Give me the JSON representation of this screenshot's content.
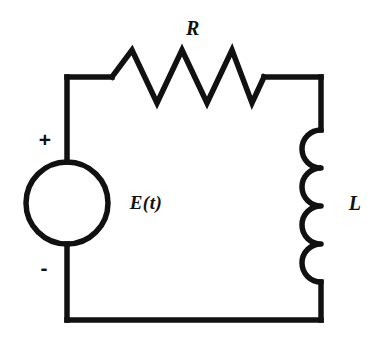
{
  "figure": {
    "background_color": "#ffffff",
    "stroke_color": "#111111",
    "width": 376,
    "height": 354
  },
  "labels": {
    "resistor": "R",
    "source": "E(t)",
    "inductor": "L",
    "polarity_positive": "+",
    "polarity_negative": "-"
  },
  "components": [
    {
      "name": "resistor",
      "symbol": "zigzag",
      "label": "R",
      "position": "top-wire",
      "peaks": 3
    },
    {
      "name": "voltage-source",
      "symbol": "circle",
      "label": "E(t)",
      "position": "left-wire",
      "polarity_top": "+",
      "polarity_bottom": "-"
    },
    {
      "name": "inductor",
      "symbol": "coil",
      "label": "L",
      "position": "right-wire",
      "coils": 4
    }
  ],
  "geometry": {
    "loop": {
      "left_x": 67,
      "right_x": 321,
      "top_y": 77,
      "bottom_y": 320
    },
    "resistor": {
      "start_x": 112,
      "end_x": 264,
      "peak_y": 50,
      "valley_y": 103,
      "baseline_y": 77
    },
    "source_circle": {
      "center_x": 67,
      "center_y": 203,
      "radius": 41
    },
    "inductor": {
      "x": 321,
      "start_y": 130,
      "end_y": 282,
      "coil_radius": 20,
      "coil_count": 4
    }
  }
}
